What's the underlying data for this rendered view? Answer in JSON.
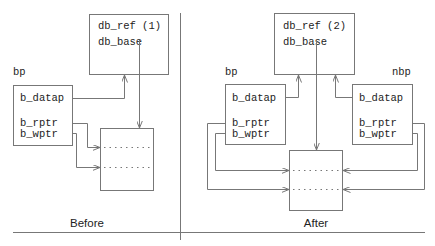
{
  "diagram": {
    "panels": [
      {
        "caption": "Before",
        "dblk": {
          "ref_label": "db_ref (1)",
          "base_label": "db_base"
        },
        "buffers": [
          {
            "pointer_label": "bp",
            "fields": [
              "b_datap",
              "b_rptr",
              "b_wptr"
            ]
          }
        ]
      },
      {
        "caption": "After",
        "dblk": {
          "ref_label": "db_ref (2)",
          "base_label": "db_base"
        },
        "buffers": [
          {
            "pointer_label": "bp",
            "fields": [
              "b_datap",
              "b_rptr",
              "b_wptr"
            ]
          },
          {
            "pointer_label": "nbp",
            "fields": [
              "b_datap",
              "b_rptr",
              "b_wptr"
            ]
          }
        ]
      }
    ],
    "colors": {
      "line": "#777777",
      "text": "#222222",
      "background": "#ffffff"
    }
  }
}
